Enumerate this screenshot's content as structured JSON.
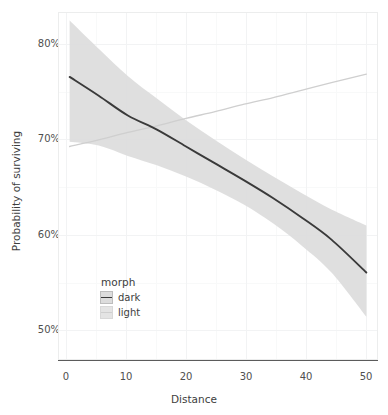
{
  "chart_data": {
    "type": "line",
    "title": "",
    "subtitle": "",
    "xlabel": "Distance",
    "ylabel": "Probability of surviving",
    "xlim": [
      -2,
      53
    ],
    "ylim": [
      0.455,
      0.825
    ],
    "x_ticks": [
      0,
      10,
      20,
      30,
      40,
      50
    ],
    "x_tick_labels": [
      "0",
      "10",
      "20",
      "30",
      "40",
      "50"
    ],
    "y_ticks": [
      0.5,
      0.6,
      0.7,
      0.8
    ],
    "y_tick_labels": [
      "50%",
      "60%",
      "70%",
      "80%"
    ],
    "grid": true,
    "legend": {
      "title": "morph",
      "position": "inside-bottom-left",
      "entries": [
        {
          "label": "dark",
          "line_color": "#3a3a3a",
          "ribbon_color": "#dcdcdc"
        },
        {
          "label": "light",
          "line_color": "#cfcfcf",
          "ribbon_color": "#e4e4e4"
        }
      ]
    },
    "x": [
      0,
      5,
      10,
      15,
      20,
      25,
      30,
      35,
      40,
      45,
      51
    ],
    "series": [
      {
        "name": "dark",
        "color": "#3a3a3a",
        "values": [
          0.756,
          0.736,
          0.715,
          0.7,
          0.682,
          0.664,
          0.646,
          0.627,
          0.606,
          0.583,
          0.548
        ],
        "ribbon_upper": [
          0.816,
          0.786,
          0.757,
          0.733,
          0.71,
          0.689,
          0.669,
          0.65,
          0.632,
          0.615,
          0.598
        ],
        "ribbon_lower": [
          0.687,
          0.683,
          0.672,
          0.662,
          0.65,
          0.636,
          0.62,
          0.6,
          0.576,
          0.548,
          0.501
        ]
      },
      {
        "name": "light",
        "color": "#cfcfcf",
        "values": [
          0.682,
          0.689,
          0.697,
          0.704,
          0.712,
          0.719,
          0.727,
          0.734,
          0.742,
          0.75,
          0.759
        ],
        "ribbon_upper": null,
        "ribbon_lower": null
      }
    ],
    "annotations": []
  },
  "axes": {
    "x_title": "Distance",
    "y_title": "Probability of surviving",
    "x_tick_labels": [
      "0",
      "10",
      "20",
      "30",
      "40",
      "50"
    ],
    "y_tick_labels": [
      "50%",
      "60%",
      "70%",
      "80%"
    ]
  },
  "legend": {
    "title": "morph",
    "items": [
      {
        "label": "dark"
      },
      {
        "label": "light"
      }
    ]
  },
  "colors": {
    "dark_line": "#3a3a3a",
    "light_line": "#cfcfcf",
    "ribbon": "#dcdcdc",
    "grid_major": "#f2f3f4",
    "grid_minor": "#f8f9f9",
    "panel_border": "#eceded",
    "axis_line": "#5b5b5b",
    "text": "#3d3d3d",
    "background": "#ffffff"
  }
}
